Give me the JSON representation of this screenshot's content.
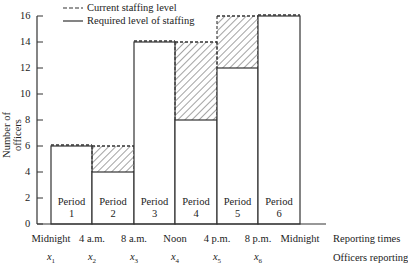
{
  "chart_data": {
    "type": "bar",
    "title": "",
    "xlabel": "Reporting times / Officers reporting",
    "ylabel": "Number of officers",
    "ylim": [
      0,
      16
    ],
    "yticks": [
      0,
      2,
      4,
      6,
      8,
      10,
      12,
      14,
      16
    ],
    "grid": false,
    "legend_position": "top-left",
    "legend": [
      "Current staffing level",
      "Required level of staffing"
    ],
    "categories": [
      "Period 1",
      "Period 2",
      "Period 3",
      "Period 4",
      "Period 5",
      "Period 6"
    ],
    "series": [
      {
        "name": "Current staffing level",
        "style": "dashed",
        "values": [
          6,
          6,
          14,
          14,
          16,
          16
        ]
      },
      {
        "name": "Required level of staffing",
        "style": "solid",
        "values": [
          6,
          4,
          14,
          8,
          12,
          16
        ]
      }
    ],
    "excess_hatched": [
      0,
      2,
      0,
      6,
      4,
      0
    ],
    "reporting_times": [
      "Midnight",
      "4 a.m.",
      "8 a.m.",
      "Noon",
      "4 p.m.",
      "8 p.m.",
      "Midnight"
    ],
    "officers_reporting": [
      "x1",
      "x2",
      "x3",
      "x4",
      "x5",
      "x6"
    ]
  },
  "legend": {
    "current": "Current staffing level",
    "required": "Required level of staffing"
  },
  "axis": {
    "ylabel": "Number of officers",
    "yticks": [
      "0",
      "2",
      "4",
      "6",
      "8",
      "10",
      "12",
      "14",
      "16"
    ],
    "row_label_times": "Reporting times",
    "row_label_officers": "Officers reporting"
  },
  "periods": [
    {
      "word": "Period",
      "num": "1"
    },
    {
      "word": "Period",
      "num": "2"
    },
    {
      "word": "Period",
      "num": "3"
    },
    {
      "word": "Period",
      "num": "4"
    },
    {
      "word": "Period",
      "num": "5"
    },
    {
      "word": "Period",
      "num": "6"
    }
  ],
  "times": [
    "Midnight",
    "4 a.m.",
    "8 a.m.",
    "Noon",
    "4 p.m.",
    "8 p.m.",
    "Midnight"
  ],
  "officers": [
    {
      "v": "x",
      "sub": "1"
    },
    {
      "v": "x",
      "sub": "2"
    },
    {
      "v": "x",
      "sub": "3"
    },
    {
      "v": "x",
      "sub": "4"
    },
    {
      "v": "x",
      "sub": "5"
    },
    {
      "v": "x",
      "sub": "6"
    }
  ]
}
